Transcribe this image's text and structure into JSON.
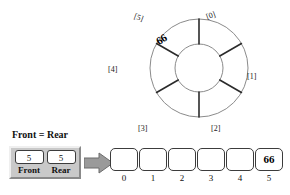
{
  "diagram": {
    "ring": {
      "name": "circular-queue-ring",
      "slot_count": 6,
      "slots": [
        {
          "label": "[0]",
          "value": ""
        },
        {
          "label": "[1]",
          "value": ""
        },
        {
          "label": "[2]",
          "value": ""
        },
        {
          "label": "[3]",
          "value": ""
        },
        {
          "label": "[4]",
          "value": ""
        },
        {
          "label": "[5]",
          "value": "66"
        }
      ],
      "filled_slot_index": 5,
      "filled_slot_value": "66"
    },
    "pointers": {
      "title": "Front = Rear",
      "cells": [
        {
          "name": "Front",
          "value": "5"
        },
        {
          "name": "Rear",
          "value": "5"
        }
      ]
    },
    "arrow": {
      "icon": "right-arrow-icon",
      "direction": "right"
    },
    "array": {
      "name": "linear-array",
      "cells": [
        {
          "index": "0",
          "value": ""
        },
        {
          "index": "1",
          "value": ""
        },
        {
          "index": "2",
          "value": ""
        },
        {
          "index": "3",
          "value": ""
        },
        {
          "index": "4",
          "value": ""
        },
        {
          "index": "5",
          "value": "66"
        }
      ]
    },
    "colors": {
      "background": "#ffffff",
      "outline": "#3c3c3c",
      "ring_stroke": "#6f6f6f",
      "divider_stroke": "#2b2b2b",
      "panel_face": "#c9c9c9",
      "panel_light": "#efefef",
      "panel_shadow": "#8a8a8a",
      "arrow_fill": "#9a9a9a",
      "text": "#111111"
    }
  }
}
